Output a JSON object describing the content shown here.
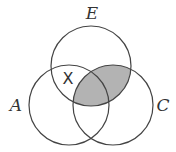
{
  "diagram": {
    "type": "venn",
    "sets": [
      {
        "label": "E",
        "cx": 91,
        "cy": 66,
        "r": 40
      },
      {
        "label": "A",
        "cx": 69,
        "cy": 105,
        "r": 40
      },
      {
        "label": "C",
        "cx": 113,
        "cy": 105,
        "r": 40
      }
    ],
    "shaded_region": "E ∩ C",
    "shade_color": "#b3b3b3",
    "marker": {
      "text": "X",
      "region": "A ∩ E (not C)"
    },
    "labels": {
      "e": "E",
      "a": "A",
      "c": "C",
      "x": "X"
    }
  }
}
